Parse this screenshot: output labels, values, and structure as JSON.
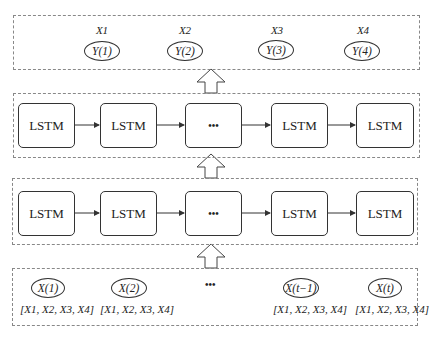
{
  "output_layer": {
    "items": [
      {
        "label": "X1",
        "node": "Y(1)"
      },
      {
        "label": "X2",
        "node": "Y(2)"
      },
      {
        "label": "X3",
        "node": "Y(3)"
      },
      {
        "label": "X4",
        "node": "Y(4)"
      }
    ]
  },
  "lstm_layer_2": {
    "cells": [
      "LSTM",
      "LSTM",
      "•••",
      "LSTM",
      "LSTM"
    ]
  },
  "lstm_layer_1": {
    "cells": [
      "LSTM",
      "LSTM",
      "•••",
      "LSTM",
      "LSTM"
    ]
  },
  "input_layer": {
    "items": [
      {
        "node": "X(1)",
        "vector": "[X1, X2, X3, X4]"
      },
      {
        "node": "X(2)",
        "vector": "[X1, X2, X3, X4]"
      },
      {
        "node": "X(t−1)",
        "vector": "[X1, X2, X3, X4]"
      },
      {
        "node": "X(t)",
        "vector": "[X1, X2, X3, X4]"
      }
    ],
    "ellipsis": "•••"
  }
}
